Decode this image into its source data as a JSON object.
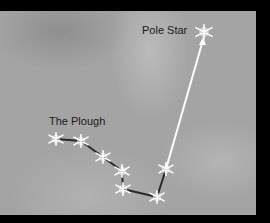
{
  "diagram": {
    "labels": {
      "plough": "The Plough",
      "pole_star": "Pole Star"
    },
    "colors": {
      "background": "#a4a4a4",
      "frame": "#000000",
      "constellation_line": "#2a2a2a",
      "pointer_arrow": "#ffffff",
      "star": "#ffffff"
    },
    "plough_stars": [
      {
        "id": "star-1"
      },
      {
        "id": "star-2"
      },
      {
        "id": "star-3"
      },
      {
        "id": "star-4"
      },
      {
        "id": "star-5"
      },
      {
        "id": "star-6"
      },
      {
        "id": "star-7"
      }
    ],
    "pole_star": {
      "id": "pole-star"
    }
  }
}
